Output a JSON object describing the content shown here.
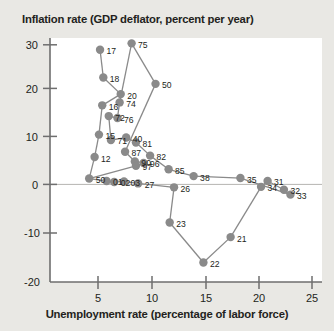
{
  "chart_data": {
    "type": "scatter",
    "title": "Inflation rate (GDP deflator, percent per year)",
    "xlabel": "Unemployment rate (percentage of labor force)",
    "ylabel": "Inflation rate (GDP deflator, percent per year)",
    "xlim": [
      0,
      25
    ],
    "ylim": [
      -20,
      30
    ],
    "xticks": [
      5,
      10,
      15,
      20,
      25
    ],
    "yticks": [
      30,
      20,
      10,
      0,
      -10,
      -20
    ],
    "grid": false,
    "legend": null,
    "marker_color": "#8a8a8a",
    "line_color": "#8a8a8a",
    "connected": true,
    "points": [
      {
        "label": "17",
        "x": 4.6,
        "y": 27.6
      },
      {
        "label": "18",
        "x": 4.9,
        "y": 21.9
      },
      {
        "label": "20",
        "x": 6.5,
        "y": 18.5
      },
      {
        "label": "16",
        "x": 4.8,
        "y": 16.2
      },
      {
        "label": "15",
        "x": 4.5,
        "y": 10.2
      },
      {
        "label": "12",
        "x": 4.1,
        "y": 5.6
      },
      {
        "label": "50",
        "x": 3.6,
        "y": 1.2
      },
      {
        "label": "01",
        "x": 5.2,
        "y": 0.7
      },
      {
        "label": "02",
        "x": 5.9,
        "y": 0.5
      },
      {
        "label": "03",
        "x": 6.8,
        "y": 0.6
      },
      {
        "label": "27",
        "x": 8.1,
        "y": 0.2
      },
      {
        "label": "26",
        "x": 11.4,
        "y": -0.6
      },
      {
        "label": "23",
        "x": 11.0,
        "y": -7.8
      },
      {
        "label": "22",
        "x": 14.1,
        "y": -16.0
      },
      {
        "label": "21",
        "x": 16.6,
        "y": -10.8
      },
      {
        "label": "34",
        "x": 19.4,
        "y": -0.5
      },
      {
        "label": "31",
        "x": 20.0,
        "y": 0.7
      },
      {
        "label": "32",
        "x": 21.5,
        "y": -1.1
      },
      {
        "label": "33",
        "x": 22.1,
        "y": -2.1
      },
      {
        "label": "35",
        "x": 17.5,
        "y": 1.3
      },
      {
        "label": "38",
        "x": 13.2,
        "y": 1.7
      },
      {
        "label": "85",
        "x": 10.9,
        "y": 3.1
      },
      {
        "label": "82",
        "x": 9.2,
        "y": 5.9
      },
      {
        "label": "81",
        "x": 7.9,
        "y": 8.6
      },
      {
        "label": "40",
        "x": 7.0,
        "y": 9.6
      },
      {
        "label": "71",
        "x": 5.6,
        "y": 9.1
      },
      {
        "label": "72",
        "x": 5.4,
        "y": 14.0
      },
      {
        "label": "76",
        "x": 6.2,
        "y": 13.6
      },
      {
        "label": "74",
        "x": 6.4,
        "y": 16.8
      },
      {
        "label": "75",
        "x": 7.5,
        "y": 28.9
      },
      {
        "label": "50b",
        "x": 9.7,
        "y": 20.6
      },
      {
        "label": "87",
        "x": 6.9,
        "y": 6.7
      },
      {
        "label": "90",
        "x": 7.8,
        "y": 4.7
      },
      {
        "label": "96",
        "x": 8.6,
        "y": 4.4
      },
      {
        "label": "97",
        "x": 7.9,
        "y": 3.8
      }
    ]
  }
}
